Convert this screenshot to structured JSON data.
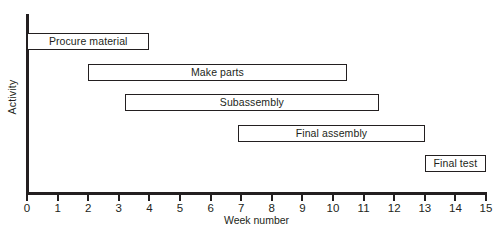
{
  "chart_data": {
    "type": "bar",
    "chart_kind": "gantt",
    "title": "",
    "xlabel": "Week number",
    "ylabel": "Activity",
    "xlim": [
      0,
      15
    ],
    "xticks": [
      0,
      1,
      2,
      3,
      4,
      5,
      6,
      7,
      8,
      9,
      10,
      11,
      12,
      13,
      14,
      15
    ],
    "xtick_labels": [
      "0",
      "1",
      "2",
      "3",
      "4",
      "5",
      "6",
      "7",
      "8",
      "9",
      "10",
      "11",
      "12",
      "13",
      "14",
      "15"
    ],
    "grid": false,
    "legend": "none",
    "categories": [
      "Procure material",
      "Make parts",
      "Subassembly",
      "Final assembly",
      "Final test"
    ],
    "tasks": [
      {
        "label": "Procure material",
        "start": 0,
        "end": 4,
        "duration": 4
      },
      {
        "label": "Make parts",
        "start": 2,
        "end": 10.45,
        "duration": 8.45
      },
      {
        "label": "Subassembly",
        "start": 3.2,
        "end": 11.5,
        "duration": 8.3
      },
      {
        "label": "Final assembly",
        "start": 6.9,
        "end": 13,
        "duration": 6.1
      },
      {
        "label": "Final test",
        "start": 13,
        "end": 15,
        "duration": 2
      }
    ],
    "colors": {
      "bar_fill": "#ffffff",
      "bar_border": "#231f20",
      "axis": "#231f20",
      "text": "#231f20",
      "background": "#ffffff"
    }
  }
}
